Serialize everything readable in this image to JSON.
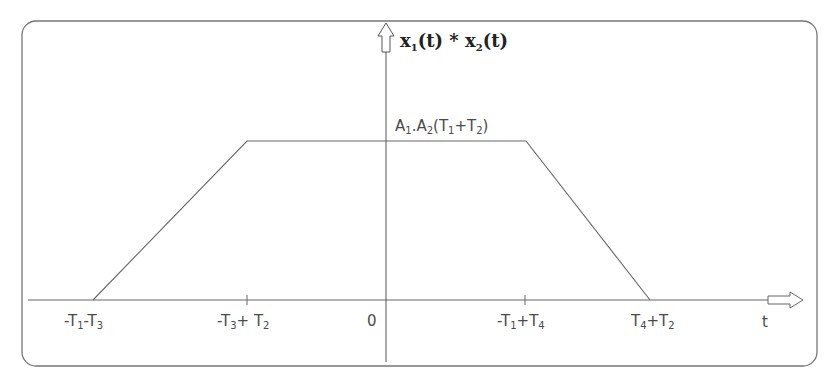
{
  "diagram": {
    "type": "convolution-result-trapezoid",
    "y_axis_label": {
      "base": "x",
      "sub1": "1",
      "mid": "(t) * x",
      "sub2": "2",
      "end": "(t)"
    },
    "x_axis_label": "t",
    "peak_label": {
      "a": "A",
      "a_sub": "1",
      "dot": ".A",
      "b_sub": "2",
      "open": "(T",
      "c_sub": "1",
      "plus": "+T",
      "d_sub": "2",
      "close": ")"
    },
    "origin_label": "0",
    "ticks": [
      {
        "id": "t1",
        "parts": [
          "-T",
          "1",
          "-T",
          "3"
        ]
      },
      {
        "id": "t2",
        "parts": [
          "-T",
          "3",
          "+ T",
          "2"
        ]
      },
      {
        "id": "t3",
        "parts": [
          "-T",
          "1",
          "+T",
          "4"
        ]
      },
      {
        "id": "t4",
        "parts": [
          "T",
          "4",
          "+T",
          "2"
        ]
      }
    ],
    "colors": {
      "line": "#555555",
      "frame": "#777777",
      "text": "#4a4a4a"
    }
  }
}
